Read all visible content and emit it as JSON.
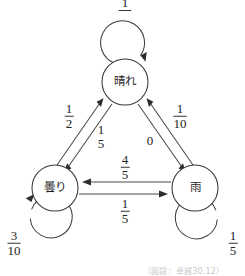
{
  "figure": {
    "type": "state-transition-diagram",
    "caption": "（図説：卓越30.12）"
  },
  "nodes": [
    {
      "id": "sunny",
      "label": "晴れ",
      "cx": 125,
      "cy": 82,
      "r": 23
    },
    {
      "id": "cloudy",
      "label": "曇り",
      "cx": 55,
      "cy": 188,
      "r": 23
    },
    {
      "id": "rain",
      "label": "雨",
      "cx": 195,
      "cy": 188,
      "r": 23
    }
  ],
  "edges": [
    {
      "id": "sunny-sunny",
      "from": "晴れ",
      "to": "晴れ",
      "label": "10",
      "label_kind": "fraction-clipped",
      "numerator": "1",
      "denominator": "10"
    },
    {
      "id": "cloudy-sunny",
      "from": "曇り",
      "to": "晴れ",
      "label_kind": "fraction",
      "numerator": "1",
      "denominator": "2"
    },
    {
      "id": "sunny-cloudy",
      "from": "晴れ",
      "to": "曇り",
      "label_kind": "fraction",
      "numerator": "1",
      "denominator": "5"
    },
    {
      "id": "rain-sunny",
      "from": "雨",
      "to": "晴れ",
      "label_kind": "fraction",
      "numerator": "1",
      "denominator": "10"
    },
    {
      "id": "sunny-rain",
      "from": "晴れ",
      "to": "雨",
      "label_kind": "scalar",
      "value": "0"
    },
    {
      "id": "rain-cloudy",
      "from": "雨",
      "to": "曇り",
      "label_kind": "fraction",
      "numerator": "4",
      "denominator": "5"
    },
    {
      "id": "cloudy-rain",
      "from": "曇り",
      "to": "雨",
      "label_kind": "fraction",
      "numerator": "1",
      "denominator": "5"
    },
    {
      "id": "cloudy-cloudy",
      "from": "曇り",
      "to": "曇り",
      "label_kind": "fraction",
      "numerator": "3",
      "denominator": "10"
    },
    {
      "id": "rain-rain",
      "from": "雨",
      "to": "雨",
      "label_kind": "fraction",
      "numerator": "1",
      "denominator": "5"
    }
  ],
  "labels": {
    "top_loop": {
      "num": "1",
      "den": "10"
    },
    "cloudy_to_sunny": {
      "num": "1",
      "den": "2"
    },
    "sunny_to_cloudy": {
      "num": "1",
      "den": "5"
    },
    "rain_to_sunny": {
      "num": "1",
      "den": "10"
    },
    "sunny_to_rain": {
      "value": "0"
    },
    "rain_to_cloudy": {
      "num": "4",
      "den": "5"
    },
    "cloudy_to_rain": {
      "num": "1",
      "den": "5"
    },
    "cloudy_loop": {
      "num": "3",
      "den": "10"
    },
    "rain_loop": {
      "num": "1",
      "den": "5"
    }
  },
  "colors": {
    "stroke": "#3a3a3a",
    "text": "#242424",
    "background": "#ffffff"
  }
}
